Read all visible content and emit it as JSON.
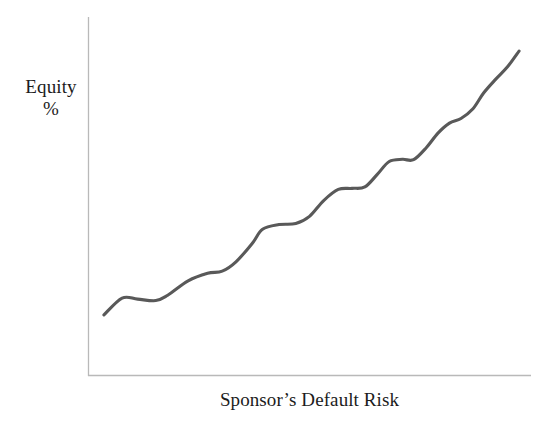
{
  "figure": {
    "background_color": "#ffffff",
    "width": 555,
    "height": 426
  },
  "axes": {
    "color": "#b9b9b9",
    "y_axis_label_line1": "Equity",
    "y_axis_label_line2": "%",
    "x_axis_label": "Sponsor’s Default Risk"
  },
  "curve": {
    "color": "#595959",
    "width": 3.1
  },
  "chart_data": {
    "type": "line",
    "title": "",
    "xlabel": "Sponsor’s Default Risk",
    "ylabel": "Equity %",
    "grid": false,
    "legend": "none",
    "axis_ticks": "none",
    "axis_range_labels": "unlabeled (qualitative axes)",
    "xlim": [
      0,
      100
    ],
    "ylim": [
      0,
      100
    ],
    "series": [
      {
        "name": "Equity %",
        "x": [
          3.6,
          7.7,
          11.2,
          15.3,
          18.0,
          22.6,
          27.0,
          30.3,
          33.4,
          37.1,
          39.4,
          43.1,
          46.9,
          50.0,
          53.2,
          56.5,
          59.6,
          62.5,
          65.3,
          68.0,
          71.0,
          73.5,
          76.4,
          79.0,
          81.6,
          84.2,
          86.9,
          89.3,
          92.0,
          94.7,
          97.3
        ],
        "y": [
          16.9,
          21.6,
          21.3,
          20.9,
          22.4,
          26.4,
          28.5,
          29.1,
          31.7,
          36.9,
          40.8,
          42.1,
          42.4,
          44.4,
          48.8,
          51.9,
          52.2,
          52.6,
          56.1,
          59.7,
          60.3,
          60.2,
          63.6,
          67.6,
          70.4,
          71.7,
          74.4,
          78.8,
          82.6,
          86.1,
          90.5
        ]
      }
    ]
  }
}
